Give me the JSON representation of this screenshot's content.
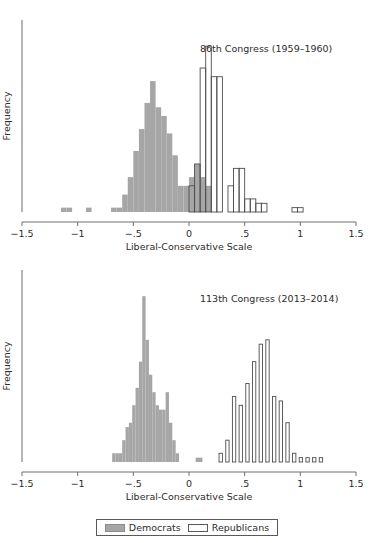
{
  "figure": {
    "legend": {
      "name": "chart-legend",
      "items": [
        {
          "label": "Democrats",
          "color": "#a6a6a6",
          "style": "filled"
        },
        {
          "label": "Republicans",
          "color": "#ffffff",
          "style": "outline"
        }
      ]
    }
  },
  "chart_data": [
    {
      "type": "bar",
      "id": "congress-86",
      "title": "86th Congress (1959–1960)",
      "xlabel": "Liberal-Conservative Scale",
      "ylabel": "Frequency",
      "xlim": [
        -1.5,
        1.5
      ],
      "ylim": [
        0,
        44
      ],
      "xticks": [
        -1.5,
        -1,
        -0.5,
        0,
        0.5,
        1,
        1.5
      ],
      "xticklabels": [
        "-1.5",
        "-1",
        "-.5",
        "0",
        ".5",
        "1",
        "1.5"
      ],
      "grid": false,
      "bin_width": 0.05,
      "legend_position": "figure-bottom-center",
      "series": [
        {
          "name": "Democrats",
          "style": "filled",
          "color": "#a6a6a6",
          "bins": [
            -1.125,
            -1.075,
            -0.9,
            -0.675,
            -0.625,
            -0.575,
            -0.525,
            -0.475,
            -0.425,
            -0.375,
            -0.325,
            -0.275,
            -0.225,
            -0.175,
            -0.125,
            -0.075,
            -0.025,
            0.025,
            0.075,
            0.125,
            0.175
          ],
          "values": [
            1,
            1,
            1,
            1,
            1,
            4,
            8,
            14,
            19,
            25,
            30,
            24,
            22,
            18,
            13,
            6,
            6,
            8,
            11,
            8,
            6
          ]
        },
        {
          "name": "Republicans",
          "style": "outline",
          "color": "#ffffff",
          "bins": [
            -0.075,
            -0.025,
            0.025,
            0.075,
            0.125,
            0.175,
            0.225,
            0.275,
            0.325,
            0.375,
            0.425,
            0.475,
            0.525,
            0.575,
            0.625,
            0.675,
            0.725,
            0.95,
            1.0
          ],
          "values": [
            0,
            0,
            6,
            11,
            33,
            38,
            31,
            31,
            0,
            6,
            10,
            10,
            3,
            3,
            2,
            2,
            0,
            1,
            1
          ]
        }
      ]
    },
    {
      "type": "bar",
      "id": "congress-113",
      "title": "113th Congress (2013–2014)",
      "xlabel": "Liberal-Conservative Scale",
      "ylabel": "Frequency",
      "xlim": [
        -1.5,
        1.5
      ],
      "ylim": [
        0,
        44
      ],
      "xticks": [
        -1.5,
        -1,
        -0.5,
        0,
        0.5,
        1,
        1.5
      ],
      "xticklabels": [
        "-1.5",
        "-1",
        "-.5",
        "0",
        ".5",
        "1",
        "1.5"
      ],
      "grid": false,
      "bin_width": 0.03,
      "legend_position": "figure-bottom-center",
      "series": [
        {
          "name": "Democrats",
          "style": "filled",
          "color": "#a6a6a6",
          "bins": [
            -0.675,
            -0.645,
            -0.615,
            -0.585,
            -0.555,
            -0.525,
            -0.495,
            -0.465,
            -0.435,
            -0.405,
            -0.375,
            -0.345,
            -0.315,
            -0.285,
            -0.255,
            -0.225,
            -0.195,
            -0.165,
            -0.135,
            -0.105,
            0.075,
            0.105
          ],
          "values": [
            2,
            2,
            2,
            5,
            8,
            9,
            13,
            17,
            23,
            38,
            28,
            20,
            16,
            13,
            12,
            12,
            16,
            9,
            5,
            2,
            1,
            1
          ]
        },
        {
          "name": "Republicans",
          "style": "outline",
          "color": "#ffffff",
          "bins": [
            0.285,
            0.345,
            0.405,
            0.465,
            0.525,
            0.585,
            0.645,
            0.705,
            0.765,
            0.825,
            0.885,
            0.945,
            1.005,
            1.065,
            1.125,
            1.185
          ],
          "values": [
            2,
            5,
            15,
            13,
            18,
            23,
            27,
            28,
            15,
            14,
            9,
            2,
            1,
            1,
            1,
            1
          ]
        }
      ]
    }
  ]
}
